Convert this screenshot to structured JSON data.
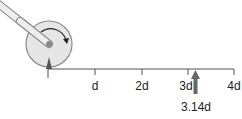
{
  "diagram": {
    "colors": {
      "wheel_fill": "#e6e6e6",
      "wheel_stroke": "#8a8a8a",
      "axis": "#555555",
      "arrow": "#666666",
      "handle_fill": "#eaeaea",
      "handle_stroke": "#8a8a8a"
    },
    "axis": {
      "ticks": [
        {
          "label": "",
          "value": 0
        },
        {
          "label": "d",
          "value": 1
        },
        {
          "label": "2d",
          "value": 2
        },
        {
          "label": "3d",
          "value": 3
        },
        {
          "label": "4d",
          "value": 4
        }
      ]
    },
    "marker": {
      "label": "3.14d",
      "value": 3.14
    }
  }
}
